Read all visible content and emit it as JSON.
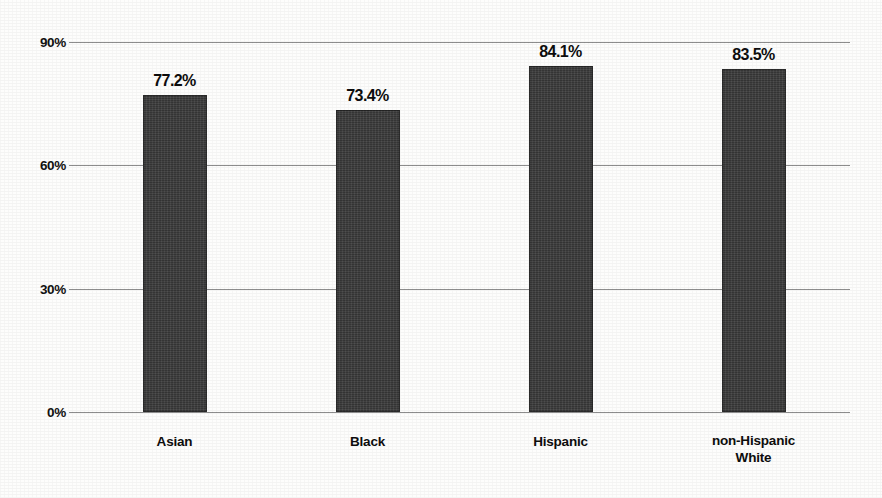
{
  "chart_data": {
    "type": "bar",
    "title": "",
    "subtitle": "",
    "xlabel": "",
    "ylabel": "",
    "categories": [
      "Asian",
      "Black",
      "Hispanic",
      "non-Hispanic\nWhite"
    ],
    "values": [
      77.2,
      73.4,
      84.1,
      83.5
    ],
    "value_labels": [
      "77.2%",
      "73.4%",
      "84.1%",
      "83.5%"
    ],
    "ylim": [
      0,
      90
    ],
    "yticks": [
      0,
      30,
      60,
      90
    ],
    "ytick_labels": [
      "0%",
      "30%",
      "60%",
      "90%"
    ],
    "grid": true,
    "legend": "none",
    "bar_color": "#3b3b3b",
    "gridline_color": "#8d8d8d",
    "text_color": "#0d0d0d",
    "background": "#fdfdfc"
  }
}
